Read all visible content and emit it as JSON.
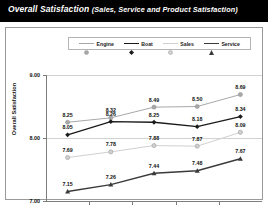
{
  "header": {
    "title": "Overall Satisfaction",
    "subtitle": "(Sales, Service and Product Satisfaction)"
  },
  "chart_data": {
    "type": "line",
    "title": "Overall Satisfaction",
    "subtitle": "(Sales, Service and Product Satisfaction)",
    "xlabel": "",
    "ylabel": "Overall Satisfaction",
    "categories": [
      "2002",
      "2003",
      "2004",
      "2005",
      "2006"
    ],
    "ylim": [
      7.0,
      9.0
    ],
    "yticks": [
      "7.00",
      "8.00",
      "9.00"
    ],
    "ytick_values": [
      7.0,
      8.0,
      9.0
    ],
    "grid": true,
    "legend_position": "top",
    "series": [
      {
        "name": "Engine",
        "color": "#a8a8a8",
        "marker": "circle",
        "values": [
          8.25,
          8.32,
          8.49,
          8.5,
          8.69
        ],
        "labels": [
          "8.25",
          "8.32",
          "8.49",
          "8.50",
          "8.69"
        ]
      },
      {
        "name": "Boat",
        "color": "#1a1a1a",
        "marker": "diamond",
        "values": [
          8.05,
          8.26,
          8.25,
          8.18,
          8.34
        ],
        "labels": [
          "8.05",
          "8.26",
          "8.25",
          "8.18",
          "8.34"
        ]
      },
      {
        "name": "Sales",
        "color": "#d0d0d0",
        "marker": "circle",
        "values": [
          7.69,
          7.78,
          7.88,
          7.87,
          8.09
        ],
        "labels": [
          "7.69",
          "7.78",
          "7.88",
          "7.87",
          "8.09"
        ]
      },
      {
        "name": "Service",
        "color": "#3a3a3a",
        "marker": "triangle",
        "values": [
          7.15,
          7.26,
          7.44,
          7.48,
          7.67
        ],
        "labels": [
          "7.15",
          "7.26",
          "7.44",
          "7.48",
          "7.67"
        ]
      }
    ]
  }
}
